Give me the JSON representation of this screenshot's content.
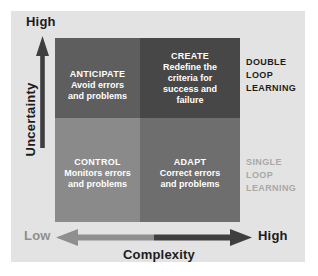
{
  "diagram": {
    "axes": {
      "vertical": {
        "label": "Uncertainty",
        "high_label": "High",
        "arrow_icon": "arrow-up-icon"
      },
      "horizontal": {
        "label": "Complexity",
        "low_label": "Low",
        "high_label": "High",
        "arrow_icon": "arrow-left-right-icon"
      }
    },
    "quadrants": [
      {
        "id": "anticipate",
        "position": "top-left",
        "title": "ANTICIPATE",
        "description_lines": [
          "Avoid errors",
          "and problems"
        ],
        "fill": "#5e5e5e"
      },
      {
        "id": "create",
        "position": "top-right",
        "title": "CREATE",
        "description_lines": [
          "Redefine the",
          "criteria for",
          "success and",
          "failure"
        ],
        "fill": "#474747"
      },
      {
        "id": "control",
        "position": "bottom-left",
        "title": "CONTROL",
        "description_lines": [
          "Monitors errors",
          "and problems"
        ],
        "fill": "#8a8a8a"
      },
      {
        "id": "adapt",
        "position": "bottom-right",
        "title": "ADAPT",
        "description_lines": [
          "Correct errors",
          "and problems"
        ],
        "fill": "#6e6e6e"
      }
    ],
    "side_annotations": [
      {
        "id": "double-loop",
        "lines": [
          "DOUBLE",
          "LOOP",
          "LEARNING"
        ],
        "color": "#1c1c1c"
      },
      {
        "id": "single-loop",
        "lines": [
          "SINGLE",
          "LOOP",
          "LEARNING"
        ],
        "color": "#a8a8a8"
      }
    ],
    "colors": {
      "page_background": "#ffffff",
      "panel_background": "#e3e3e3",
      "axis_dark": "#3f3f3f",
      "axis_light": "#8f8f8f",
      "quadrant_text": "#ffffff"
    }
  }
}
